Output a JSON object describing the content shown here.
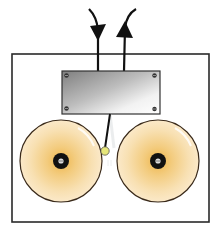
{
  "diagram": {
    "frame": {
      "x": 12,
      "y": 54,
      "width": 197,
      "height": 168,
      "stroke": "#2a2a2a",
      "fill": "#ffffff"
    },
    "wires": [
      {
        "name": "incoming-wire",
        "direction": "in",
        "x": 98,
        "arrow": "down"
      },
      {
        "name": "outgoing-wire",
        "direction": "out",
        "x": 124,
        "arrow": "up"
      }
    ],
    "electromagnet_plate": {
      "x": 62,
      "y": 71,
      "width": 98,
      "height": 43,
      "screws": 4,
      "gradient": [
        "#8e8e8e",
        "#c8c8c8",
        "#f4f4f4"
      ]
    },
    "hammer": {
      "arm_from": [
        110,
        114
      ],
      "arm_to": [
        105,
        148
      ],
      "ball": {
        "cx": 105,
        "cy": 151,
        "r": 4,
        "color": "#e6e67a"
      }
    },
    "bells": [
      {
        "name": "left-gong",
        "cx": 61,
        "cy": 161,
        "r": 41
      },
      {
        "name": "right-gong",
        "cx": 158,
        "cy": 161,
        "r": 41
      }
    ],
    "colors": {
      "bell_inner": "#f0c060",
      "bell_outer": "#fbe8c4",
      "line": "#1a1a1a"
    }
  }
}
